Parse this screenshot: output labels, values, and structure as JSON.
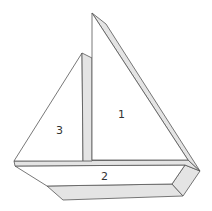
{
  "diagram": {
    "pieces": [
      {
        "id": "piece-1",
        "label": "1",
        "shape": "main sail (right triangle)"
      },
      {
        "id": "piece-2",
        "label": "2",
        "shape": "hull (trapezoid)"
      },
      {
        "id": "piece-3",
        "label": "3",
        "shape": "jib sail (triangle)"
      }
    ],
    "colors": {
      "face": "#ffffff",
      "edge_shading": "#e4e4e4",
      "outline": "#555555",
      "label": "#333333"
    }
  }
}
